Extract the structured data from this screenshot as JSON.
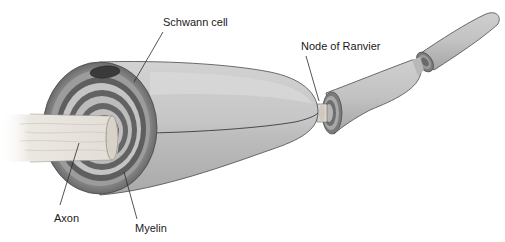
{
  "diagram": {
    "labels": {
      "schwann_cell": "Schwann cell",
      "node_of_ranvier": "Node of Ranvier",
      "axon": "Axon",
      "myelin": "Myelin"
    },
    "colors": {
      "background": "#ffffff",
      "schwann_body": "#c4c4c4",
      "schwann_highlight": "#dedede",
      "myelin_dark": "#6e6e6e",
      "myelin_light": "#b5b5b5",
      "axon": "#e6e2dc",
      "nucleus": "#3a3a3a",
      "leader_line": "#2a2a2a"
    }
  }
}
